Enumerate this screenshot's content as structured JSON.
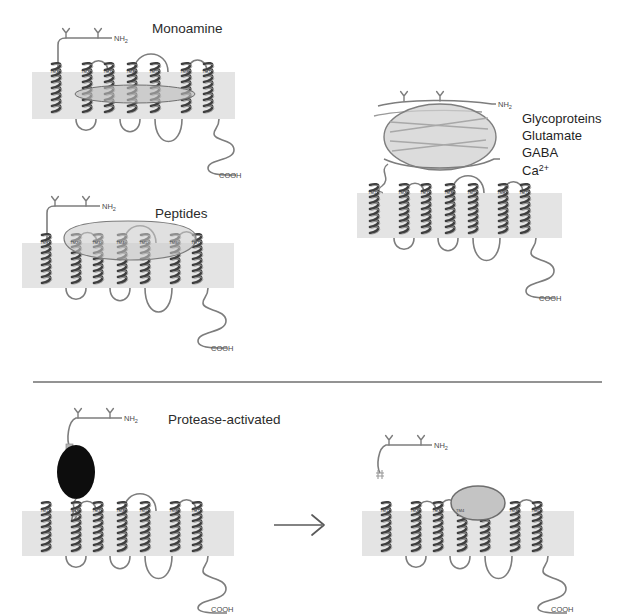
{
  "figure": {
    "background_color": "#ffffff",
    "membrane_color": "#e2e2e2",
    "helix_color": "#4d4d4d",
    "loop_color": "#7a7a7a",
    "blob_fill": "#c9c9c9",
    "blob_stroke": "#8c8c8c",
    "black_blob_fill": "#0d0d0d",
    "divider_color": "#6f6f6f"
  },
  "panels": [
    {
      "id": "monoamine",
      "title": "Monoamine",
      "n_terminus_label": "NH",
      "n_terminus_sub": "2",
      "c_terminus_label": "COOH",
      "glycan_count": 2,
      "tm_labels": [
        "TM1",
        "TM2",
        "TM3",
        "TM4",
        "TM5",
        "TM6",
        "TM7"
      ],
      "binding_site": "intramembrane-pocket",
      "blob_shape": "flat-ellipse"
    },
    {
      "id": "peptides",
      "title": "Peptides",
      "n_terminus_label": "NH",
      "n_terminus_sub": "2",
      "c_terminus_label": "COOH",
      "glycan_count": 2,
      "tm_labels": [
        "TM1",
        "TM2",
        "TM3",
        "TM4",
        "TM5",
        "TM6",
        "TM7"
      ],
      "binding_site": "extracellular-surface",
      "blob_shape": "shield"
    },
    {
      "id": "glycoproteins",
      "titles": [
        "Glycoproteins",
        "Glutamate",
        "GABA",
        "Ca"
      ],
      "ca_superscript": "2+",
      "n_terminus_label": "NH",
      "n_terminus_sub": "2",
      "c_terminus_label": "COOH",
      "glycan_count": 2,
      "tm_labels": [
        "TM1",
        "TM2",
        "TM3",
        "TM4",
        "TM5",
        "TM6",
        "TM7"
      ],
      "binding_site": "large-n-terminal-domain",
      "blob_shape": "large-ellipse"
    },
    {
      "id": "protease-activated-before",
      "title": "Protease-activated",
      "n_terminus_label": "NH",
      "n_terminus_sub": "2",
      "c_terminus_label": "COOH",
      "glycan_count": 2,
      "tm_labels": [
        "TM1",
        "TM2",
        "TM3",
        "TM4",
        "TM5",
        "TM6",
        "TM7"
      ],
      "binding_site": "uncleaved-n-terminus",
      "blob_shape": "black-ellipse"
    },
    {
      "id": "protease-activated-after",
      "title": "",
      "n_terminus_label": "NH",
      "n_terminus_sub": "2",
      "c_terminus_label": "COOH",
      "glycan_count": 2,
      "tm_labels": [
        "TM1",
        "TM2",
        "TM3",
        "TM4",
        "TM5",
        "TM6",
        "TM7"
      ],
      "binding_site": "tethered-ligand",
      "blob_shape": "gray-ellipse"
    }
  ],
  "arrow": {
    "direction": "right",
    "name": "cleavage-arrow"
  },
  "divider": {
    "present": true
  }
}
